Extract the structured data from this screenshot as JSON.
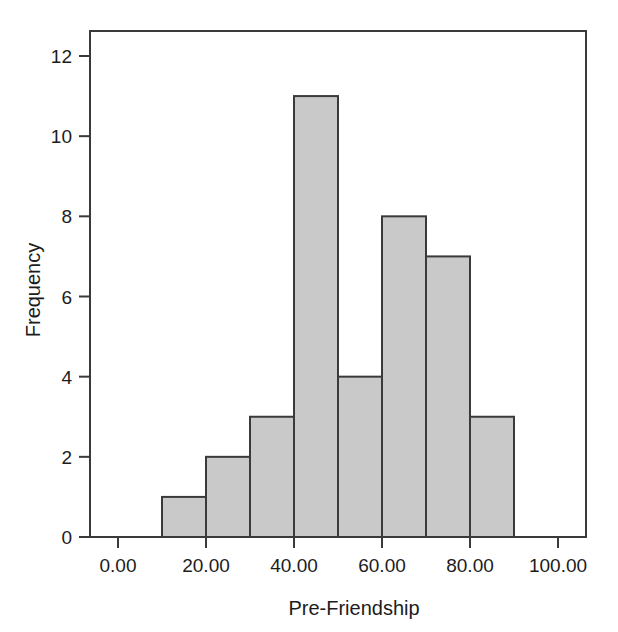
{
  "chart_data": {
    "type": "bar",
    "title": "",
    "xlabel": "Pre-Friendship",
    "ylabel": "Frequency",
    "xlim": [
      -5,
      108
    ],
    "ylim": [
      0,
      12.6
    ],
    "grid": false,
    "legend": null,
    "bin_width": 10,
    "bin_edges": [
      10,
      20,
      30,
      40,
      50,
      60,
      70,
      80,
      90
    ],
    "categories": [
      "10-20",
      "20-30",
      "30-40",
      "40-50",
      "50-60",
      "60-70",
      "70-80",
      "80-90"
    ],
    "values": [
      1,
      2,
      3,
      11,
      4,
      8,
      7,
      3
    ],
    "bars": [
      {
        "x0": 10,
        "x1": 20,
        "value": 1
      },
      {
        "x0": 20,
        "x1": 30,
        "value": 2
      },
      {
        "x0": 30,
        "x1": 40,
        "value": 3
      },
      {
        "x0": 40,
        "x1": 50,
        "value": 11
      },
      {
        "x0": 50,
        "x1": 60,
        "value": 4
      },
      {
        "x0": 60,
        "x1": 70,
        "value": 8
      },
      {
        "x0": 70,
        "x1": 80,
        "value": 7
      },
      {
        "x0": 80,
        "x1": 90,
        "value": 3
      }
    ],
    "xticks": [
      0,
      20,
      40,
      60,
      80,
      100
    ],
    "xtick_labels": [
      "0.00",
      "20.00",
      "40.00",
      "60.00",
      "80.00",
      "100.00"
    ],
    "yticks": [
      0,
      2,
      4,
      6,
      8,
      10,
      12
    ],
    "ytick_labels": [
      "0",
      "2",
      "4",
      "6",
      "8",
      "10",
      "12"
    ],
    "colors": {
      "bar_fill": "#c9c9c9",
      "bar_stroke": "#3a3a3a",
      "axis": "#3a3a3a",
      "text": "#1c1c1c",
      "background": "#ffffff"
    }
  }
}
